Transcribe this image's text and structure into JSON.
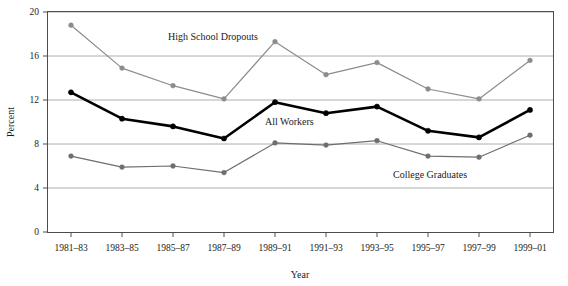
{
  "chart_data": {
    "type": "line",
    "title": "",
    "xlabel": "Year",
    "ylabel": "Percent",
    "grid": true,
    "legend_position": "inline-annotations",
    "categories": [
      "1981–83",
      "1983–85",
      "1985–87",
      "1987–89",
      "1989–91",
      "1991–93",
      "1993–95",
      "1995–97",
      "1997–99",
      "1999–01"
    ],
    "ylim": [
      0,
      20
    ],
    "yticks": [
      0,
      4,
      8,
      12,
      16,
      20
    ],
    "ytick_labels": [
      "0",
      "4",
      "8",
      "12",
      "16",
      "20"
    ],
    "series": [
      {
        "name": "High School Dropouts",
        "color": "#8c8c8c",
        "line_width": 1.2,
        "marker": "circle",
        "values": [
          18.8,
          14.9,
          13.3,
          12.1,
          17.3,
          14.3,
          15.4,
          13.0,
          12.1,
          15.6
        ]
      },
      {
        "name": "All Workers",
        "color": "#000000",
        "line_width": 2.6,
        "marker": "circle",
        "values": [
          12.7,
          10.3,
          9.6,
          8.5,
          11.8,
          10.8,
          11.4,
          9.2,
          8.6,
          11.1
        ]
      },
      {
        "name": "College Graduates",
        "color": "#6e6e6e",
        "line_width": 1.2,
        "marker": "circle",
        "values": [
          6.9,
          5.9,
          6.0,
          5.4,
          8.1,
          7.9,
          8.3,
          6.9,
          6.8,
          8.8
        ]
      }
    ],
    "annotations": [
      {
        "text": "High School Dropouts",
        "x_px": 168,
        "y_px": 40,
        "anchor": "start"
      },
      {
        "text": "All Workers",
        "x_px": 265,
        "y_px": 125,
        "anchor": "start"
      },
      {
        "text": "College Graduates",
        "x_px": 393,
        "y_px": 178,
        "anchor": "start"
      }
    ]
  },
  "axes": {
    "y_title": "Percent",
    "x_title": "Year"
  }
}
